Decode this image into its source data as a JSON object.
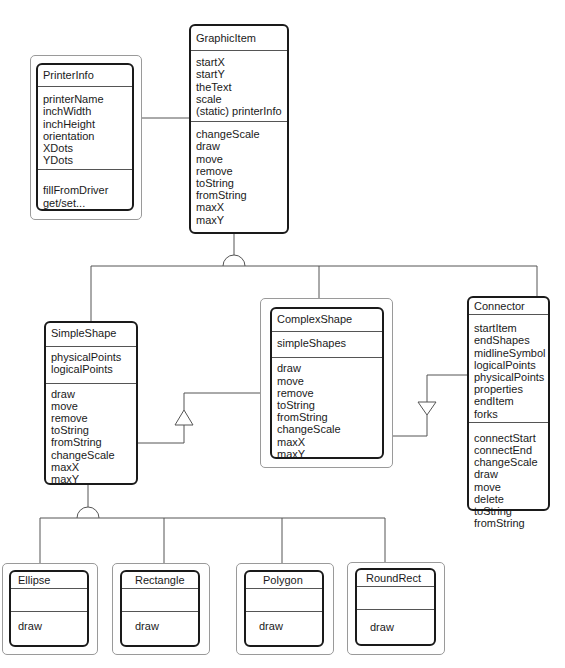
{
  "diagram": {
    "type": "class-diagram",
    "classes": {
      "printerInfo": {
        "name": "PrinterInfo",
        "attributes": [
          "printerName",
          "inchWidth",
          "inchHeight",
          "orientation",
          "XDots",
          "YDots"
        ],
        "methods": [
          "fillFromDriver",
          "get/set..."
        ]
      },
      "graphicItem": {
        "name": "GraphicItem",
        "attributes": [
          "startX",
          "startY",
          "theText",
          "scale",
          "(static) printerInfo"
        ],
        "methods": [
          "changeScale",
          "draw",
          "move",
          "remove",
          "toString",
          "fromString",
          "maxX",
          "maxY"
        ]
      },
      "simpleShape": {
        "name": "SimpleShape",
        "attributes": [
          "physicalPoints",
          "logicalPoints"
        ],
        "methods": [
          "draw",
          "move",
          "remove",
          "toString",
          "fromString",
          "changeScale",
          "maxX",
          "maxY"
        ]
      },
      "complexShape": {
        "name": "ComplexShape",
        "attributes": [
          "simpleShapes"
        ],
        "methods": [
          "draw",
          "move",
          "remove",
          "toString",
          "fromString",
          "changeScale",
          "maxX",
          "maxY"
        ]
      },
      "connector": {
        "name": "Connector",
        "attributes": [
          "startItem",
          "endShapes",
          "midlineSymbol",
          "logicalPoints",
          "physicalPoints",
          "properties",
          "endItem",
          "forks"
        ],
        "methods": [
          "connectStart",
          "connectEnd",
          "changeScale",
          "draw",
          "move",
          "delete",
          "toString",
          "fromString"
        ]
      },
      "ellipse": {
        "name": "Ellipse",
        "attributes": [],
        "methods": [
          "draw"
        ]
      },
      "rectangle": {
        "name": "Rectangle",
        "attributes": [],
        "methods": [
          "draw"
        ]
      },
      "polygon": {
        "name": "Polygon",
        "attributes": [],
        "methods": [
          "draw"
        ]
      },
      "roundRect": {
        "name": "RoundRect",
        "attributes": [],
        "methods": [
          "draw"
        ]
      }
    },
    "relationships": [
      {
        "type": "association",
        "from": "PrinterInfo",
        "to": "GraphicItem"
      },
      {
        "type": "inheritance",
        "parent": "GraphicItem",
        "children": [
          "SimpleShape",
          "ComplexShape",
          "Connector"
        ]
      },
      {
        "type": "aggregation",
        "from": "ComplexShape",
        "to": "SimpleShape"
      },
      {
        "type": "aggregation",
        "from": "ComplexShape",
        "to": "Connector"
      },
      {
        "type": "inheritance",
        "parent": "SimpleShape",
        "children": [
          "Ellipse",
          "Rectangle",
          "Polygon",
          "RoundRect"
        ]
      }
    ],
    "colors": {
      "line": "#555555",
      "box_border": "#1a1a1a",
      "outer_border": "#9a9a9a",
      "background": "#ffffff"
    }
  }
}
